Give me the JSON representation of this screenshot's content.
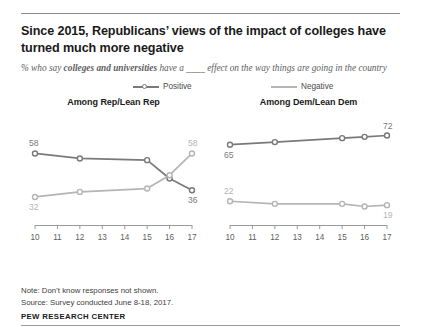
{
  "title": "Since 2015, Republicans’ views of the impact of colleges have turned much more negative",
  "subtitle": {
    "pre": "% who say ",
    "bold": "colleges and universities",
    "post": " have a ____ effect on the way things are going in the country"
  },
  "legend": [
    {
      "label": "Positive",
      "marker": "open-circle-line",
      "color": "#7a7a7a"
    },
    {
      "label": "Negative",
      "marker": "plain-line",
      "color": "#b5b5b5"
    }
  ],
  "notes": {
    "note": "Note: Don’t know responses not shown.",
    "source": "Source: Survey conducted June 8-18, 2017."
  },
  "brand": "PEW RESEARCH CENTER",
  "colors": {
    "positive": "#7a7a7a",
    "negative": "#b5b5b5",
    "axis": "#9a9a9a",
    "title": "#1a1a1a",
    "subtitle": "#5e5e5e"
  },
  "chart_data": [
    {
      "type": "line",
      "title": "Among Rep/Lean Rep",
      "xlabel": "",
      "ylabel": "",
      "x": [
        10,
        12,
        15,
        16,
        17
      ],
      "tick_labels": [
        "10",
        "11",
        "12",
        "13",
        "14",
        "15",
        "16",
        "17"
      ],
      "ticks": [
        10,
        11,
        12,
        13,
        14,
        15,
        16,
        17
      ],
      "xlim": [
        10,
        17
      ],
      "ylim": [
        20,
        75
      ],
      "grid": false,
      "legend_position": "top-center",
      "series": [
        {
          "name": "Positive",
          "values": [
            58,
            55,
            54,
            43,
            36
          ],
          "color": "#7a7a7a",
          "labels": [
            {
              "index": 0,
              "text": "58",
              "position": "above-left"
            },
            {
              "index": 4,
              "text": "36",
              "position": "below-right"
            }
          ]
        },
        {
          "name": "Negative",
          "values": [
            32,
            35,
            37,
            45,
            58
          ],
          "color": "#b5b5b5",
          "labels": [
            {
              "index": 0,
              "text": "32",
              "position": "below-left"
            },
            {
              "index": 4,
              "text": "58",
              "position": "above-right"
            }
          ]
        }
      ]
    },
    {
      "type": "line",
      "title": "Among Dem/Lean Dem",
      "xlabel": "",
      "ylabel": "",
      "x": [
        10,
        12,
        15,
        16,
        17
      ],
      "tick_labels": [
        "10",
        "11",
        "12",
        "13",
        "14",
        "15",
        "16",
        "17"
      ],
      "ticks": [
        10,
        11,
        12,
        13,
        14,
        15,
        16,
        17
      ],
      "xlim": [
        10,
        17
      ],
      "ylim": [
        10,
        80
      ],
      "grid": false,
      "legend_position": "top-center",
      "series": [
        {
          "name": "Positive",
          "values": [
            65,
            67,
            70,
            71,
            72
          ],
          "color": "#7a7a7a",
          "labels": [
            {
              "index": 0,
              "text": "65",
              "position": "below-left"
            },
            {
              "index": 4,
              "text": "72",
              "position": "above-right"
            }
          ]
        },
        {
          "name": "Negative",
          "values": [
            22,
            20,
            20,
            18,
            19
          ],
          "color": "#b5b5b5",
          "labels": [
            {
              "index": 0,
              "text": "22",
              "position": "above-left"
            },
            {
              "index": 4,
              "text": "19",
              "position": "below-right"
            }
          ]
        }
      ]
    }
  ]
}
